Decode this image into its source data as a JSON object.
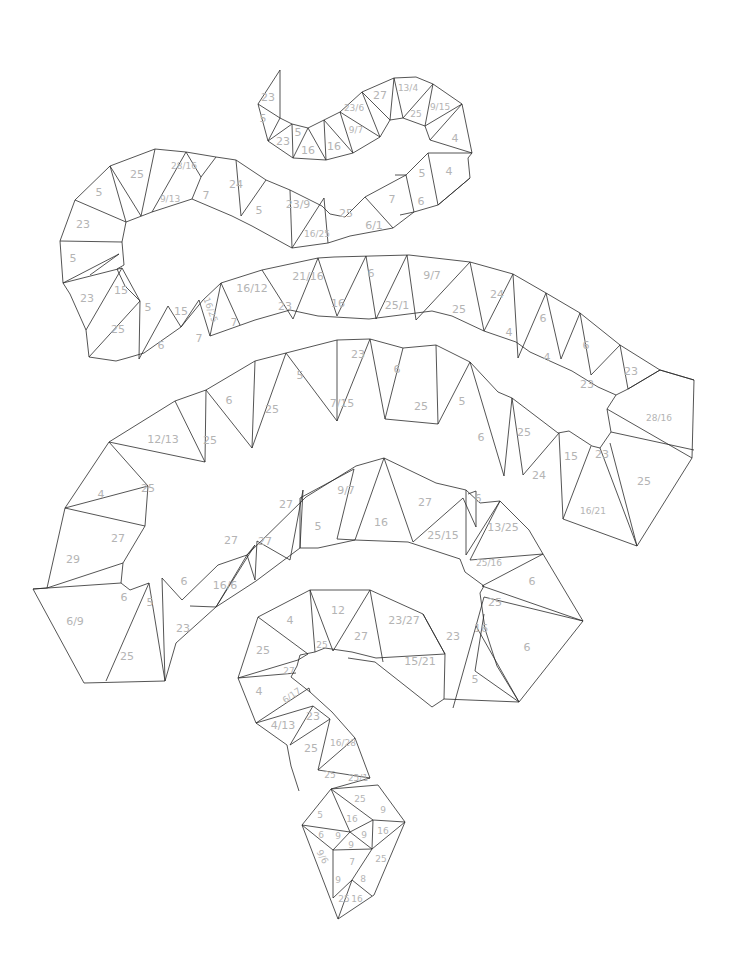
{
  "style": {
    "line_color": "#2a2a2a",
    "label_color": "#b4b4b4",
    "background": "#ffffff"
  },
  "regions": [
    {
      "label": "23",
      "x": 268,
      "y": 97
    },
    {
      "label": "5",
      "x": 263,
      "y": 118
    },
    {
      "label": "23",
      "x": 283,
      "y": 141
    },
    {
      "label": "5",
      "x": 298,
      "y": 132
    },
    {
      "label": "16",
      "x": 308,
      "y": 150
    },
    {
      "label": "16",
      "x": 334,
      "y": 146
    },
    {
      "label": "9/7",
      "x": 356,
      "y": 130,
      "small": true
    },
    {
      "label": "23/6",
      "x": 354,
      "y": 108,
      "small": true
    },
    {
      "label": "27",
      "x": 380,
      "y": 95
    },
    {
      "label": "13/4",
      "x": 408,
      "y": 88,
      "small": true
    },
    {
      "label": "25",
      "x": 416,
      "y": 114,
      "small": true
    },
    {
      "label": "9/15",
      "x": 440,
      "y": 107,
      "small": true
    },
    {
      "label": "4",
      "x": 455,
      "y": 138
    },
    {
      "label": "5",
      "x": 422,
      "y": 173
    },
    {
      "label": "4",
      "x": 449,
      "y": 171
    },
    {
      "label": "7",
      "x": 392,
      "y": 199
    },
    {
      "label": "6",
      "x": 421,
      "y": 201
    },
    {
      "label": "25",
      "x": 346,
      "y": 213
    },
    {
      "label": "6/1",
      "x": 374,
      "y": 225
    },
    {
      "label": "23/9",
      "x": 298,
      "y": 204
    },
    {
      "label": "16/25",
      "x": 317,
      "y": 234,
      "small": true
    },
    {
      "label": "5",
      "x": 259,
      "y": 210
    },
    {
      "label": "24",
      "x": 236,
      "y": 184
    },
    {
      "label": "7",
      "x": 206,
      "y": 195
    },
    {
      "label": "28/16",
      "x": 184,
      "y": 166,
      "small": true
    },
    {
      "label": "9/13",
      "x": 170,
      "y": 199,
      "small": true
    },
    {
      "label": "25",
      "x": 137,
      "y": 174
    },
    {
      "label": "5",
      "x": 99,
      "y": 192
    },
    {
      "label": "23",
      "x": 83,
      "y": 224
    },
    {
      "label": "5",
      "x": 73,
      "y": 258
    },
    {
      "label": "23",
      "x": 87,
      "y": 298
    },
    {
      "label": "15",
      "x": 121,
      "y": 290
    },
    {
      "label": "25",
      "x": 118,
      "y": 329
    },
    {
      "label": "5",
      "x": 148,
      "y": 307
    },
    {
      "label": "6",
      "x": 161,
      "y": 345
    },
    {
      "label": "15",
      "x": 181,
      "y": 311
    },
    {
      "label": "16/25",
      "x": 210,
      "y": 310,
      "small": true,
      "rotate": 70
    },
    {
      "label": "7",
      "x": 199,
      "y": 338
    },
    {
      "label": "16/12",
      "x": 252,
      "y": 288
    },
    {
      "label": "7",
      "x": 234,
      "y": 322
    },
    {
      "label": "23",
      "x": 285,
      "y": 306
    },
    {
      "label": "21/16",
      "x": 308,
      "y": 276
    },
    {
      "label": "16",
      "x": 338,
      "y": 303
    },
    {
      "label": "6",
      "x": 371,
      "y": 273
    },
    {
      "label": "25/1",
      "x": 397,
      "y": 305
    },
    {
      "label": "9/7",
      "x": 432,
      "y": 275
    },
    {
      "label": "25",
      "x": 459,
      "y": 309
    },
    {
      "label": "24",
      "x": 497,
      "y": 294
    },
    {
      "label": "4",
      "x": 509,
      "y": 332
    },
    {
      "label": "6",
      "x": 543,
      "y": 318
    },
    {
      "label": "4",
      "x": 547,
      "y": 357
    },
    {
      "label": "6",
      "x": 586,
      "y": 345
    },
    {
      "label": "23",
      "x": 587,
      "y": 384
    },
    {
      "label": "23",
      "x": 631,
      "y": 371
    },
    {
      "label": "28/16",
      "x": 659,
      "y": 418,
      "small": true
    },
    {
      "label": "25",
      "x": 644,
      "y": 481
    },
    {
      "label": "23",
      "x": 602,
      "y": 454
    },
    {
      "label": "16/21",
      "x": 593,
      "y": 511,
      "small": true
    },
    {
      "label": "15",
      "x": 571,
      "y": 456
    },
    {
      "label": "24",
      "x": 539,
      "y": 475
    },
    {
      "label": "25",
      "x": 524,
      "y": 432
    },
    {
      "label": "6",
      "x": 481,
      "y": 437
    },
    {
      "label": "5",
      "x": 462,
      "y": 401
    },
    {
      "label": "25",
      "x": 421,
      "y": 406
    },
    {
      "label": "6",
      "x": 397,
      "y": 369
    },
    {
      "label": "23",
      "x": 358,
      "y": 354
    },
    {
      "label": "7/15",
      "x": 342,
      "y": 403
    },
    {
      "label": "5",
      "x": 300,
      "y": 375
    },
    {
      "label": "25",
      "x": 272,
      "y": 409
    },
    {
      "label": "6",
      "x": 229,
      "y": 400
    },
    {
      "label": "25",
      "x": 210,
      "y": 440
    },
    {
      "label": "12/13",
      "x": 163,
      "y": 439
    },
    {
      "label": "25",
      "x": 148,
      "y": 488
    },
    {
      "label": "4",
      "x": 101,
      "y": 494
    },
    {
      "label": "27",
      "x": 118,
      "y": 538
    },
    {
      "label": "29",
      "x": 73,
      "y": 559
    },
    {
      "label": "6/9",
      "x": 75,
      "y": 621
    },
    {
      "label": "6",
      "x": 124,
      "y": 597
    },
    {
      "label": "5",
      "x": 150,
      "y": 602
    },
    {
      "label": "25",
      "x": 127,
      "y": 656
    },
    {
      "label": "23",
      "x": 183,
      "y": 628
    },
    {
      "label": "6",
      "x": 184,
      "y": 581
    },
    {
      "label": "16/6",
      "x": 225,
      "y": 585
    },
    {
      "label": "27",
      "x": 231,
      "y": 540
    },
    {
      "label": "27",
      "x": 265,
      "y": 541
    },
    {
      "label": "27",
      "x": 286,
      "y": 504
    },
    {
      "label": "5",
      "x": 318,
      "y": 526
    },
    {
      "label": "9/7",
      "x": 346,
      "y": 490
    },
    {
      "label": "16",
      "x": 381,
      "y": 522
    },
    {
      "label": "27",
      "x": 425,
      "y": 502
    },
    {
      "label": "25/15",
      "x": 443,
      "y": 535
    },
    {
      "label": "6",
      "x": 478,
      "y": 498
    },
    {
      "label": "13/25",
      "x": 503,
      "y": 527
    },
    {
      "label": "25/16",
      "x": 489,
      "y": 563,
      "small": true
    },
    {
      "label": "6",
      "x": 532,
      "y": 581
    },
    {
      "label": "25",
      "x": 495,
      "y": 602
    },
    {
      "label": "16",
      "x": 481,
      "y": 628
    },
    {
      "label": "6",
      "x": 527,
      "y": 647
    },
    {
      "label": "5",
      "x": 475,
      "y": 679
    },
    {
      "label": "23",
      "x": 453,
      "y": 636
    },
    {
      "label": "15/21",
      "x": 420,
      "y": 661
    },
    {
      "label": "23/27",
      "x": 404,
      "y": 620
    },
    {
      "label": "27",
      "x": 361,
      "y": 636
    },
    {
      "label": "12",
      "x": 338,
      "y": 610
    },
    {
      "label": "25",
      "x": 322,
      "y": 645,
      "small": true
    },
    {
      "label": "4",
      "x": 290,
      "y": 620
    },
    {
      "label": "25",
      "x": 263,
      "y": 650
    },
    {
      "label": "27",
      "x": 289,
      "y": 671,
      "small": true
    },
    {
      "label": "4",
      "x": 259,
      "y": 691
    },
    {
      "label": "6/17",
      "x": 292,
      "y": 696,
      "small": true,
      "rotate": -35
    },
    {
      "label": "23",
      "x": 313,
      "y": 716
    },
    {
      "label": "4/13",
      "x": 283,
      "y": 725
    },
    {
      "label": "25",
      "x": 311,
      "y": 748
    },
    {
      "label": "16/28",
      "x": 343,
      "y": 743,
      "small": true
    },
    {
      "label": "25",
      "x": 330,
      "y": 775,
      "small": true
    },
    {
      "label": "25/1",
      "x": 358,
      "y": 778,
      "small": true
    },
    {
      "label": "25",
      "x": 360,
      "y": 799,
      "small": true
    },
    {
      "label": "5",
      "x": 320,
      "y": 815,
      "small": true
    },
    {
      "label": "16",
      "x": 352,
      "y": 819,
      "small": true
    },
    {
      "label": "9",
      "x": 383,
      "y": 810,
      "small": true
    },
    {
      "label": "6",
      "x": 321,
      "y": 835,
      "small": true
    },
    {
      "label": "9",
      "x": 338,
      "y": 836,
      "small": true
    },
    {
      "label": "9",
      "x": 364,
      "y": 835,
      "small": true
    },
    {
      "label": "16",
      "x": 383,
      "y": 831,
      "small": true
    },
    {
      "label": "9",
      "x": 351,
      "y": 845,
      "small": true
    },
    {
      "label": "9/6",
      "x": 322,
      "y": 857,
      "small": true,
      "rotate": 60
    },
    {
      "label": "7",
      "x": 352,
      "y": 862,
      "small": true
    },
    {
      "label": "25",
      "x": 381,
      "y": 859,
      "small": true
    },
    {
      "label": "9",
      "x": 338,
      "y": 880,
      "small": true
    },
    {
      "label": "8",
      "x": 363,
      "y": 879,
      "small": true
    },
    {
      "label": "25",
      "x": 344,
      "y": 899,
      "small": true
    },
    {
      "label": "16",
      "x": 357,
      "y": 899,
      "small": true
    }
  ]
}
